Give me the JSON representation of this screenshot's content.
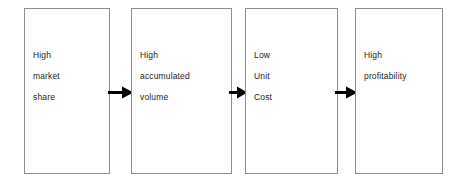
{
  "diagram": {
    "type": "process-flow",
    "orientation": "left-to-right",
    "background_color": "#ffffff",
    "box_border_color": "#8e8e8e",
    "text_color": "#1c1c1c",
    "arrow_color": "#000000",
    "boxes": [
      {
        "id": "box-1",
        "lines": [
          "High",
          "market",
          "share"
        ],
        "x": 24,
        "y": 8,
        "width": 86,
        "height": 166
      },
      {
        "id": "box-2",
        "lines": [
          "High",
          "accumulated",
          "volume"
        ],
        "x": 131,
        "y": 8,
        "width": 101,
        "height": 166
      },
      {
        "id": "box-3",
        "lines": [
          "Low",
          "Unit",
          "Cost"
        ],
        "x": 245,
        "y": 8,
        "width": 93,
        "height": 166
      },
      {
        "id": "box-4",
        "lines": [
          "High",
          "profitability"
        ],
        "x": 355,
        "y": 8,
        "width": 88,
        "height": 166
      }
    ],
    "arrows": [
      {
        "id": "arrow-1",
        "from": "box-1",
        "to": "box-2",
        "x": 108,
        "width": 26
      },
      {
        "id": "arrow-2",
        "from": "box-2",
        "to": "box-3",
        "x": 229,
        "width": 19
      },
      {
        "id": "arrow-3",
        "from": "box-3",
        "to": "box-4",
        "x": 335,
        "width": 23
      }
    ]
  }
}
